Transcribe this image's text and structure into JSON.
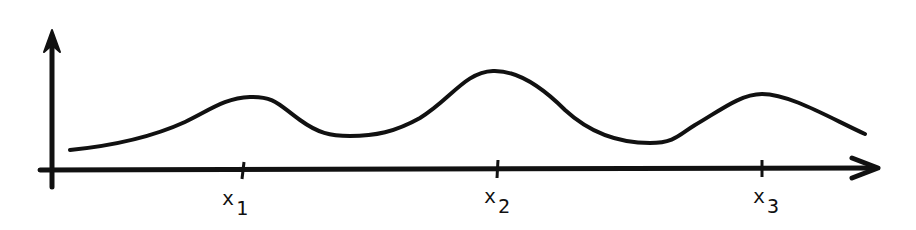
{
  "figure": {
    "stroke_color": "#111111",
    "background": "#ffffff",
    "axes": {
      "y_axis": {
        "x": 52,
        "y_top": 30,
        "y_bottom": 187,
        "arrow": "up"
      },
      "x_axis": {
        "y": 170,
        "x_left": 40,
        "x_right": 880,
        "arrow": "right"
      }
    },
    "curve_points": [
      [
        70,
        150
      ],
      [
        150,
        133
      ],
      [
        245,
        97
      ],
      [
        280,
        105
      ],
      [
        345,
        135
      ],
      [
        410,
        125
      ],
      [
        493,
        71
      ],
      [
        560,
        105
      ],
      [
        650,
        143
      ],
      [
        690,
        132
      ],
      [
        762,
        94
      ],
      [
        865,
        135
      ]
    ],
    "ticks": [
      {
        "x": 243,
        "label": "x",
        "subscript": "1"
      },
      {
        "x": 498,
        "label": "x",
        "subscript": "2"
      },
      {
        "x": 762,
        "label": "x",
        "subscript": "3"
      }
    ]
  }
}
